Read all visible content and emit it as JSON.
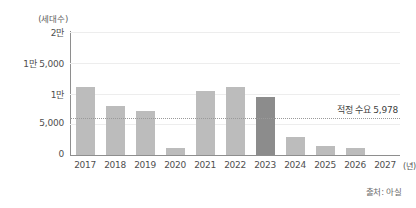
{
  "chart_data": {
    "type": "bar",
    "title": "",
    "subtitle": "",
    "xlabel": "(년)",
    "ylabel": "(세대수)",
    "categories": [
      "2017",
      "2018",
      "2019",
      "2020",
      "2021",
      "2022",
      "2023",
      "2024",
      "2025",
      "2026",
      "2027"
    ],
    "values": [
      11000,
      8000,
      7200,
      1100,
      10400,
      11000,
      9500,
      2900,
      1500,
      1100,
      0
    ],
    "ylim": [
      0,
      20000
    ],
    "ytick_values": [
      0,
      5000,
      10000,
      15000,
      20000
    ],
    "ytick_labels": [
      "0",
      "5,000",
      "1만",
      "1만 5,000",
      "2만"
    ],
    "grid": true,
    "legend": false,
    "bar_color": "#bcbcbc",
    "highlight_color": "#8c8c8c",
    "highlight_index": 6,
    "annotations": [
      {
        "type": "hline",
        "label": "적정 수요 5,978",
        "value": 5978,
        "style": "dotted",
        "color": "#9a9a9a"
      }
    ],
    "source": "출처: 아실"
  },
  "axes": {
    "y_unit_caption": "(세대수)",
    "x_unit_caption": "(년)"
  },
  "footer": {
    "source": "출처: 아실"
  }
}
